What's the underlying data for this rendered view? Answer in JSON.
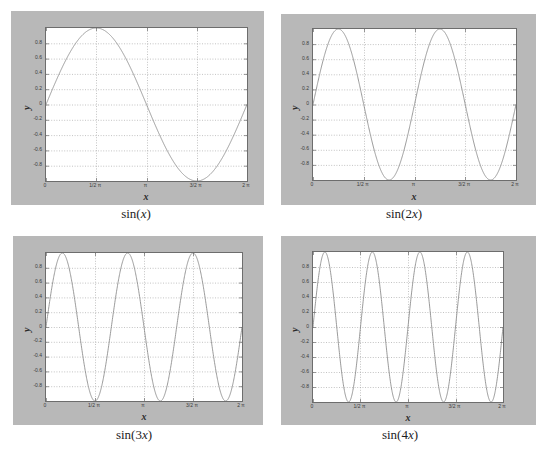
{
  "figure": {
    "background": "#ffffff",
    "panel_background": "#b8b8b8",
    "plot_background": "#ffffff",
    "curve_color": "#8f8f8f",
    "grid_color": "#9a9a9a",
    "axis_color": "#6d6d6d"
  },
  "common": {
    "xlabel": "x",
    "ylabel": "y",
    "xticks": [
      "0",
      "1/2 π",
      "π",
      "3/2 π",
      "2 π"
    ],
    "xtick_values": [
      0,
      1.5707963,
      3.1415927,
      4.712389,
      6.2831853
    ],
    "yticks": [
      "0.8",
      "0.6",
      "0.4",
      "0.2",
      "0",
      "-0.2",
      "-0.4",
      "-0.6",
      "-0.8"
    ],
    "ytick_values": [
      0.8,
      0.6,
      0.4,
      0.2,
      0,
      -0.2,
      -0.4,
      -0.6,
      -0.8
    ]
  },
  "panels": [
    {
      "caption_pre": "sin(",
      "caption_var": "x",
      "caption_post": ")"
    },
    {
      "caption_pre": "sin(2",
      "caption_var": "x",
      "caption_post": ")"
    },
    {
      "caption_pre": "sin(3",
      "caption_var": "x",
      "caption_post": ")"
    },
    {
      "caption_pre": "sin(4",
      "caption_var": "x",
      "caption_post": ")"
    }
  ],
  "chart_data": [
    {
      "type": "line",
      "title": "sin(x)",
      "xlabel": "x",
      "ylabel": "y",
      "xlim": [
        0,
        6.2831853
      ],
      "ylim": [
        -1,
        1
      ],
      "grid": true,
      "legend": null,
      "xtick_labels": [
        "0",
        "1/2 π",
        "π",
        "3/2 π",
        "2 π"
      ],
      "xtick_values": [
        0,
        1.5707963,
        3.1415927,
        4.712389,
        6.2831853
      ],
      "ytick_labels": [
        "0.8",
        "0.6",
        "0.4",
        "0.2",
        "0",
        "-0.2",
        "-0.4",
        "-0.6",
        "-0.8"
      ],
      "ytick_values": [
        0.8,
        0.6,
        0.4,
        0.2,
        0,
        -0.2,
        -0.4,
        -0.6,
        -0.8
      ],
      "series": [
        {
          "name": "sin(x)",
          "frequency": 1,
          "color": "#8f8f8f",
          "formula": "y = sin(x)",
          "x": [
            0,
            0.3927,
            0.7854,
            1.1781,
            1.5708,
            1.9635,
            2.3562,
            2.7489,
            3.1416,
            3.5343,
            3.927,
            4.3197,
            4.7124,
            5.1051,
            5.4978,
            5.8905,
            6.2832
          ],
          "y": [
            0.0,
            0.3827,
            0.7071,
            0.9239,
            1.0,
            0.9239,
            0.7071,
            0.3827,
            0.0,
            -0.3827,
            -0.7071,
            -0.9239,
            -1.0,
            -0.9239,
            -0.7071,
            -0.3827,
            0.0
          ]
        }
      ]
    },
    {
      "type": "line",
      "title": "sin(2x)",
      "xlabel": "x",
      "ylabel": "y",
      "xlim": [
        0,
        6.2831853
      ],
      "ylim": [
        -1,
        1
      ],
      "grid": true,
      "legend": null,
      "xtick_labels": [
        "0",
        "1/2 π",
        "π",
        "3/2 π",
        "2 π"
      ],
      "xtick_values": [
        0,
        1.5707963,
        3.1415927,
        4.712389,
        6.2831853
      ],
      "ytick_labels": [
        "0.8",
        "0.6",
        "0.4",
        "0.2",
        "0",
        "-0.2",
        "-0.4",
        "-0.6",
        "-0.8"
      ],
      "ytick_values": [
        0.8,
        0.6,
        0.4,
        0.2,
        0,
        -0.2,
        -0.4,
        -0.6,
        -0.8
      ],
      "series": [
        {
          "name": "sin(2x)",
          "frequency": 2,
          "color": "#8f8f8f",
          "formula": "y = sin(2x)",
          "x": [
            0,
            0.3927,
            0.7854,
            1.1781,
            1.5708,
            1.9635,
            2.3562,
            2.7489,
            3.1416,
            3.5343,
            3.927,
            4.3197,
            4.7124,
            5.1051,
            5.4978,
            5.8905,
            6.2832
          ],
          "y": [
            0.0,
            0.7071,
            1.0,
            0.7071,
            0.0,
            -0.7071,
            -1.0,
            -0.7071,
            0.0,
            0.7071,
            1.0,
            0.7071,
            0.0,
            -0.7071,
            -1.0,
            -0.7071,
            0.0
          ]
        }
      ]
    },
    {
      "type": "line",
      "title": "sin(3x)",
      "xlabel": "x",
      "ylabel": "y",
      "xlim": [
        0,
        6.2831853
      ],
      "ylim": [
        -1,
        1
      ],
      "grid": true,
      "legend": null,
      "xtick_labels": [
        "0",
        "1/2 π",
        "π",
        "3/2 π",
        "2 π"
      ],
      "xtick_values": [
        0,
        1.5707963,
        3.1415927,
        4.712389,
        6.2831853
      ],
      "ytick_labels": [
        "0.8",
        "0.6",
        "0.4",
        "0.2",
        "0",
        "-0.2",
        "-0.4",
        "-0.6",
        "-0.8"
      ],
      "ytick_values": [
        0.8,
        0.6,
        0.4,
        0.2,
        0,
        -0.2,
        -0.4,
        -0.6,
        -0.8
      ],
      "series": [
        {
          "name": "sin(3x)",
          "frequency": 3,
          "color": "#8f8f8f",
          "formula": "y = sin(3x)",
          "x": [
            0,
            0.2618,
            0.5236,
            0.7854,
            1.0472,
            1.309,
            1.5708,
            1.8326,
            2.0944,
            2.3562,
            2.618,
            2.8798,
            3.1416,
            3.4034,
            3.6652,
            3.927,
            4.1888,
            4.4506,
            4.7124,
            4.9742,
            5.236,
            5.4978,
            5.7596,
            6.0214,
            6.2832
          ],
          "y": [
            0.0,
            0.7071,
            1.0,
            0.7071,
            0.0,
            -0.7071,
            -1.0,
            -0.7071,
            0.0,
            0.7071,
            1.0,
            0.7071,
            0.0,
            -0.7071,
            -1.0,
            -0.7071,
            0.0,
            0.7071,
            1.0,
            0.7071,
            0.0,
            -0.7071,
            -1.0,
            -0.7071,
            0.0
          ]
        }
      ]
    },
    {
      "type": "line",
      "title": "sin(4x)",
      "xlabel": "x",
      "ylabel": "y",
      "xlim": [
        0,
        6.2831853
      ],
      "ylim": [
        -1,
        1
      ],
      "grid": true,
      "legend": null,
      "xtick_labels": [
        "0",
        "1/2 π",
        "π",
        "3/2 π",
        "2 π"
      ],
      "xtick_values": [
        0,
        1.5707963,
        3.1415927,
        4.712389,
        6.2831853
      ],
      "ytick_labels": [
        "0.8",
        "0.6",
        "0.4",
        "0.2",
        "0",
        "-0.2",
        "-0.4",
        "-0.6",
        "-0.8"
      ],
      "ytick_values": [
        0.8,
        0.6,
        0.4,
        0.2,
        0,
        -0.2,
        -0.4,
        -0.6,
        -0.8
      ],
      "series": [
        {
          "name": "sin(4x)",
          "frequency": 4,
          "color": "#8f8f8f",
          "formula": "y = sin(4x)",
          "x": [
            0,
            0.19635,
            0.3927,
            0.58905,
            0.7854,
            0.98175,
            1.1781,
            1.37445,
            1.5708,
            1.76715,
            1.9635,
            2.15985,
            2.3562,
            2.55255,
            2.7489,
            2.94525,
            3.1416,
            3.33795,
            3.5343,
            3.73065,
            3.927,
            4.12335,
            4.3197,
            4.51605,
            4.7124,
            4.90875,
            5.1051,
            5.30145,
            5.4978,
            5.69415,
            5.8905,
            6.08685,
            6.2832
          ],
          "y": [
            0.0,
            0.7071,
            1.0,
            0.7071,
            0.0,
            -0.7071,
            -1.0,
            -0.7071,
            0.0,
            0.7071,
            1.0,
            0.7071,
            0.0,
            -0.7071,
            -1.0,
            -0.7071,
            0.0,
            0.7071,
            1.0,
            0.7071,
            0.0,
            -0.7071,
            -1.0,
            -0.7071,
            0.0,
            0.7071,
            1.0,
            0.7071,
            0.0,
            -0.7071,
            -1.0,
            -0.7071,
            0.0
          ]
        }
      ]
    }
  ]
}
